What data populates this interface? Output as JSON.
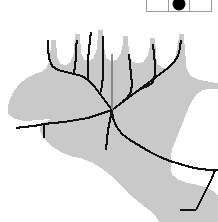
{
  "figure": {
    "shape_name": "moose-head",
    "silhouette_color": "#c9c9c9",
    "skeleton_color": "#111111",
    "secondary_branch_color": "#8a8a8a",
    "background_color": "#ffffff"
  },
  "legend": {
    "border_color": "#9a9a9a",
    "cells": [
      {
        "name": "legend-cell-left",
        "marker": "none",
        "label": ""
      },
      {
        "name": "legend-cell-center",
        "marker": "filled-circle",
        "label": ""
      },
      {
        "name": "legend-cell-right",
        "marker": "none",
        "label": ""
      }
    ]
  },
  "chart_data": {
    "type": "scatter",
    "xlabel": "",
    "ylabel": "",
    "xlim": [
      0,
      218
    ],
    "ylim": [
      0,
      222
    ],
    "grid": false,
    "legend_position": "top-right",
    "silhouette_outline": [
      [
        63,
        117
      ],
      [
        50,
        120
      ],
      [
        42,
        124
      ],
      [
        40,
        130
      ],
      [
        44,
        138
      ],
      [
        52,
        146
      ],
      [
        62,
        152
      ],
      [
        72,
        156
      ],
      [
        82,
        158
      ],
      [
        92,
        162
      ],
      [
        102,
        168
      ],
      [
        112,
        176
      ],
      [
        122,
        186
      ],
      [
        132,
        196
      ],
      [
        142,
        204
      ],
      [
        150,
        210
      ],
      [
        156,
        216
      ],
      [
        160,
        222
      ],
      [
        218,
        222
      ],
      [
        218,
        196
      ],
      [
        214,
        192
      ],
      [
        206,
        188
      ],
      [
        196,
        185
      ],
      [
        186,
        183
      ],
      [
        178,
        180
      ],
      [
        172,
        175
      ],
      [
        170,
        168
      ],
      [
        170,
        158
      ],
      [
        172,
        148
      ],
      [
        176,
        138
      ],
      [
        180,
        128
      ],
      [
        184,
        118
      ],
      [
        188,
        108
      ],
      [
        192,
        100
      ],
      [
        196,
        94
      ],
      [
        202,
        90
      ],
      [
        210,
        88
      ],
      [
        218,
        88
      ],
      [
        218,
        84
      ],
      [
        208,
        82
      ],
      [
        198,
        80
      ],
      [
        190,
        76
      ],
      [
        186,
        68
      ],
      [
        185,
        56
      ],
      [
        184,
        44
      ],
      [
        183,
        34
      ],
      [
        180,
        34
      ],
      [
        178,
        46
      ],
      [
        176,
        56
      ],
      [
        173,
        64
      ],
      [
        168,
        68
      ],
      [
        162,
        68
      ],
      [
        157,
        64
      ],
      [
        155,
        56
      ],
      [
        155,
        46
      ],
      [
        154,
        38
      ],
      [
        151,
        38
      ],
      [
        150,
        48
      ],
      [
        148,
        56
      ],
      [
        144,
        62
      ],
      [
        138,
        64
      ],
      [
        132,
        62
      ],
      [
        129,
        56
      ],
      [
        128,
        46
      ],
      [
        127,
        36
      ],
      [
        124,
        36
      ],
      [
        123,
        46
      ],
      [
        121,
        54
      ],
      [
        117,
        60
      ],
      [
        111,
        62
      ],
      [
        106,
        58
      ],
      [
        104,
        50
      ],
      [
        103,
        40
      ],
      [
        102,
        30
      ],
      [
        99,
        30
      ],
      [
        98,
        40
      ],
      [
        97,
        50
      ],
      [
        94,
        58
      ],
      [
        89,
        62
      ],
      [
        84,
        60
      ],
      [
        81,
        54
      ],
      [
        80,
        44
      ],
      [
        79,
        34
      ],
      [
        76,
        34
      ],
      [
        75,
        44
      ],
      [
        74,
        54
      ],
      [
        71,
        62
      ],
      [
        66,
        66
      ],
      [
        60,
        64
      ],
      [
        57,
        58
      ],
      [
        56,
        48
      ],
      [
        55,
        40
      ],
      [
        52,
        40
      ],
      [
        51,
        50
      ],
      [
        50,
        60
      ],
      [
        47,
        68
      ],
      [
        42,
        72
      ],
      [
        36,
        74
      ],
      [
        28,
        78
      ],
      [
        20,
        84
      ],
      [
        14,
        92
      ],
      [
        10,
        100
      ],
      [
        8,
        108
      ],
      [
        9,
        114
      ],
      [
        14,
        118
      ],
      [
        22,
        120
      ],
      [
        32,
        120
      ],
      [
        44,
        119
      ],
      [
        55,
        118
      ],
      [
        63,
        117
      ]
    ],
    "skeleton_edges": [
      {
        "name": "trunk-main",
        "points": [
          [
            112,
            110
          ],
          [
            120,
            104
          ],
          [
            128,
            98
          ],
          [
            136,
            92
          ],
          [
            144,
            86
          ],
          [
            152,
            80
          ],
          [
            160,
            74
          ],
          [
            168,
            68
          ],
          [
            174,
            62
          ],
          [
            178,
            56
          ],
          [
            180,
            48
          ],
          [
            181,
            40
          ]
        ]
      },
      {
        "name": "branch-right-inner",
        "points": [
          [
            136,
            92
          ],
          [
            142,
            88
          ],
          [
            148,
            86
          ],
          [
            153,
            82
          ],
          [
            155,
            74
          ],
          [
            155,
            64
          ],
          [
            154,
            54
          ],
          [
            153,
            44
          ]
        ]
      },
      {
        "name": "branch-right-mid",
        "points": [
          [
            122,
            102
          ],
          [
            127,
            98
          ],
          [
            131,
            92
          ],
          [
            132,
            84
          ],
          [
            131,
            74
          ],
          [
            130,
            64
          ],
          [
            129,
            54
          ]
        ]
      },
      {
        "name": "branch-left-upper",
        "points": [
          [
            112,
            110
          ],
          [
            106,
            102
          ],
          [
            100,
            94
          ],
          [
            94,
            86
          ],
          [
            88,
            80
          ],
          [
            82,
            76
          ],
          [
            74,
            74
          ],
          [
            66,
            72
          ],
          [
            58,
            70
          ],
          [
            52,
            66
          ],
          [
            49,
            58
          ],
          [
            48,
            48
          ],
          [
            48,
            40
          ]
        ]
      },
      {
        "name": "branch-left-tine-a",
        "points": [
          [
            88,
            80
          ],
          [
            88,
            70
          ],
          [
            88,
            60
          ],
          [
            89,
            50
          ],
          [
            90,
            40
          ],
          [
            91,
            32
          ]
        ]
      },
      {
        "name": "branch-left-tine-b",
        "points": [
          [
            74,
            74
          ],
          [
            75,
            66
          ],
          [
            76,
            58
          ],
          [
            76,
            48
          ],
          [
            77,
            40
          ]
        ]
      },
      {
        "name": "branch-left-tine-c",
        "points": [
          [
            100,
            94
          ],
          [
            102,
            86
          ],
          [
            103,
            76
          ],
          [
            103,
            66
          ],
          [
            103,
            56
          ],
          [
            103,
            46
          ],
          [
            103,
            36
          ]
        ]
      },
      {
        "name": "center-stem-gray",
        "points": [
          [
            112,
            110
          ],
          [
            112,
            98
          ],
          [
            112,
            86
          ],
          [
            112,
            74
          ],
          [
            112,
            62
          ],
          [
            112,
            54
          ]
        ]
      },
      {
        "name": "branch-left-lower",
        "points": [
          [
            112,
            110
          ],
          [
            100,
            114
          ],
          [
            88,
            118
          ],
          [
            76,
            120
          ],
          [
            64,
            122
          ],
          [
            54,
            123
          ],
          [
            44,
            124
          ],
          [
            34,
            126
          ],
          [
            24,
            127
          ],
          [
            16,
            128
          ]
        ]
      },
      {
        "name": "branch-left-stub",
        "points": [
          [
            44,
            124
          ],
          [
            44,
            132
          ],
          [
            44,
            138
          ]
        ]
      },
      {
        "name": "branch-neck",
        "points": [
          [
            112,
            110
          ],
          [
            113,
            118
          ],
          [
            116,
            126
          ],
          [
            122,
            134
          ],
          [
            130,
            140
          ],
          [
            140,
            146
          ],
          [
            150,
            152
          ],
          [
            160,
            157
          ],
          [
            170,
            161
          ],
          [
            180,
            164
          ],
          [
            190,
            167
          ],
          [
            200,
            169
          ],
          [
            210,
            170
          ],
          [
            218,
            170
          ]
        ]
      },
      {
        "name": "branch-muzzle",
        "points": [
          [
            112,
            110
          ],
          [
            110,
            120
          ],
          [
            108,
            130
          ],
          [
            107,
            140
          ],
          [
            106,
            150
          ]
        ]
      },
      {
        "name": "branch-jaw",
        "points": [
          [
            196,
            210
          ],
          [
            188,
            210
          ],
          [
            180,
            210
          ]
        ]
      },
      {
        "name": "branch-chest",
        "points": [
          [
            196,
            210
          ],
          [
            200,
            202
          ],
          [
            204,
            194
          ],
          [
            208,
            186
          ],
          [
            212,
            178
          ],
          [
            215,
            170
          ]
        ]
      }
    ],
    "legend_markers": [
      {
        "cell": 1,
        "type": "none"
      },
      {
        "cell": 2,
        "type": "filled-circle",
        "color": "#000000"
      },
      {
        "cell": 3,
        "type": "none"
      }
    ]
  }
}
